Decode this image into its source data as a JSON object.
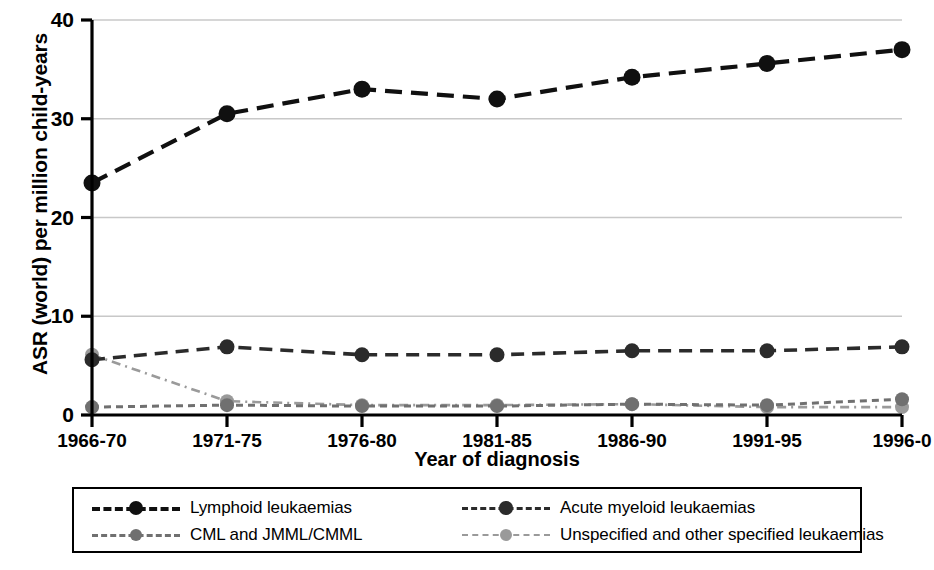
{
  "chart_data": {
    "type": "line",
    "title": "",
    "xlabel": "Year of diagnosis",
    "ylabel": "ASR (world) per million child-years",
    "categories": [
      "1966-70",
      "1971-75",
      "1976-80",
      "1981-85",
      "1986-90",
      "1991-95",
      "1996-0"
    ],
    "ylim": [
      0,
      40
    ],
    "yticks": [
      0,
      10,
      20,
      30,
      40
    ],
    "ytick_labels": [
      "0",
      "10",
      "20",
      "30",
      "40"
    ],
    "grid": true,
    "grid_axis": "y",
    "legend_position": "below",
    "series": [
      {
        "name": "Lymphoid leukaemias",
        "color": "#101010",
        "dash": "long-dash",
        "marker": "circle",
        "values": [
          23.5,
          30.5,
          33.0,
          32.0,
          34.2,
          35.6,
          37.0
        ]
      },
      {
        "name": "Acute myeloid leukaemias",
        "color": "#2b2b2b",
        "dash": "dash",
        "marker": "circle",
        "values": [
          5.6,
          6.9,
          6.1,
          6.1,
          6.5,
          6.5,
          6.9
        ]
      },
      {
        "name": "CML and JMML/CMML",
        "color": "#707070",
        "dash": "short-dash",
        "marker": "circle",
        "values": [
          0.8,
          1.0,
          0.9,
          0.9,
          1.1,
          1.0,
          1.6
        ]
      },
      {
        "name": "Unspecified and other specified leukaemias",
        "color": "#9a9a9a",
        "dash": "dash-dot",
        "marker": "circle",
        "values": [
          6.1,
          1.4,
          1.0,
          1.0,
          1.1,
          0.8,
          0.8
        ]
      }
    ],
    "colors": {
      "axis": "#000000",
      "grid": "#c8c8c8",
      "background": "#ffffff"
    }
  },
  "legend": {
    "entries": [
      "Lymphoid leukaemias",
      "Acute myeloid leukaemias",
      "CML and JMML/CMML",
      "Unspecified and other specified leukaemias"
    ]
  }
}
